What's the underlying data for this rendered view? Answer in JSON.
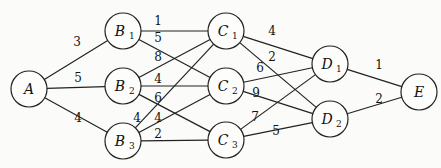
{
  "graph": {
    "nodes": [
      {
        "id": "A",
        "label": "A",
        "sub": "",
        "x": 29,
        "y": 89,
        "r": 18
      },
      {
        "id": "B1",
        "label": "B",
        "sub": "1",
        "x": 123,
        "y": 31,
        "r": 18
      },
      {
        "id": "B2",
        "label": "B",
        "sub": "2",
        "x": 123,
        "y": 86,
        "r": 18
      },
      {
        "id": "B3",
        "label": "B",
        "sub": "3",
        "x": 123,
        "y": 141,
        "r": 18
      },
      {
        "id": "C1",
        "label": "C",
        "sub": "1",
        "x": 226,
        "y": 31,
        "r": 18
      },
      {
        "id": "C2",
        "label": "C",
        "sub": "2",
        "x": 226,
        "y": 86,
        "r": 18
      },
      {
        "id": "C3",
        "label": "C",
        "sub": "3",
        "x": 226,
        "y": 140,
        "r": 18
      },
      {
        "id": "D1",
        "label": "D",
        "sub": "1",
        "x": 330,
        "y": 64,
        "r": 18
      },
      {
        "id": "D2",
        "label": "D",
        "sub": "2",
        "x": 330,
        "y": 119,
        "r": 18
      },
      {
        "id": "E",
        "label": "E",
        "sub": "",
        "x": 419,
        "y": 92,
        "r": 18
      }
    ],
    "edges": [
      {
        "from": "A",
        "to": "B1",
        "weight": "3",
        "lx": 77,
        "ly": 46
      },
      {
        "from": "A",
        "to": "B2",
        "weight": "5",
        "lx": 78,
        "ly": 82
      },
      {
        "from": "A",
        "to": "B3",
        "weight": "4",
        "lx": 78,
        "ly": 122
      },
      {
        "from": "B1",
        "to": "C1",
        "weight": "1",
        "lx": 158,
        "ly": 25
      },
      {
        "from": "B1",
        "to": "C2",
        "weight": "5",
        "lx": 158,
        "ly": 42
      },
      {
        "from": "B2",
        "to": "C1",
        "weight": "8",
        "lx": 158,
        "ly": 61
      },
      {
        "from": "B2",
        "to": "C2",
        "weight": "4",
        "lx": 158,
        "ly": 83
      },
      {
        "from": "B2",
        "to": "C3",
        "weight": "6",
        "lx": 158,
        "ly": 102
      },
      {
        "from": "B3",
        "to": "C1",
        "weight": "4",
        "lx": 137,
        "ly": 122
      },
      {
        "from": "B3",
        "to": "C2",
        "weight": "4",
        "lx": 158,
        "ly": 122
      },
      {
        "from": "B3",
        "to": "C3",
        "weight": "2",
        "lx": 158,
        "ly": 138
      },
      {
        "from": "C1",
        "to": "D1",
        "weight": "4",
        "lx": 272,
        "ly": 35
      },
      {
        "from": "C1",
        "to": "D2",
        "weight": "2",
        "lx": 272,
        "ly": 61
      },
      {
        "from": "C2",
        "to": "D1",
        "weight": "6",
        "lx": 260,
        "ly": 72
      },
      {
        "from": "C2",
        "to": "D2",
        "weight": "9",
        "lx": 256,
        "ly": 97
      },
      {
        "from": "C3",
        "to": "D1",
        "weight": "7",
        "lx": 255,
        "ly": 121
      },
      {
        "from": "C3",
        "to": "D2",
        "weight": "5",
        "lx": 276,
        "ly": 135
      },
      {
        "from": "D1",
        "to": "E",
        "weight": "1",
        "lx": 379,
        "ly": 69
      },
      {
        "from": "D2",
        "to": "E",
        "weight": "2",
        "lx": 379,
        "ly": 103
      }
    ]
  }
}
